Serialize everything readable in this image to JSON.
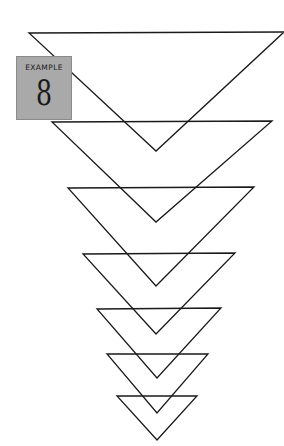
{
  "example": {
    "caption": "EXAMPLE",
    "number": "8",
    "box_color": "#a9a9a9"
  },
  "figure": {
    "stroke_color": "#1a1a1a",
    "triangles": [
      {
        "left": [
          29,
          33
        ],
        "right": [
          284,
          32
        ],
        "apex": [
          156,
          151
        ]
      },
      {
        "left": [
          52,
          122
        ],
        "right": [
          272,
          121
        ],
        "apex": [
          156,
          222
        ]
      },
      {
        "left": [
          68,
          188
        ],
        "right": [
          254,
          187
        ],
        "apex": [
          156,
          286
        ]
      },
      {
        "left": [
          83,
          254
        ],
        "right": [
          235,
          253
        ],
        "apex": [
          156,
          334
        ]
      },
      {
        "left": [
          97,
          309
        ],
        "right": [
          221,
          308
        ],
        "apex": [
          157,
          378
        ]
      },
      {
        "left": [
          107,
          354
        ],
        "right": [
          208,
          354
        ],
        "apex": [
          157,
          413
        ]
      },
      {
        "left": [
          117,
          396
        ],
        "right": [
          197,
          396
        ],
        "apex": [
          157,
          440
        ]
      }
    ]
  }
}
